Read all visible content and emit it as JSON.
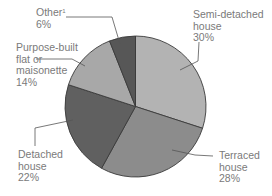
{
  "chart_data": {
    "type": "pie",
    "title": "",
    "start_angle_deg": 0,
    "direction": "clockwise",
    "slices": [
      {
        "label": "Semi-detached house",
        "value": 30,
        "color": "#b3b3b3",
        "lines": [
          "Semi-detached",
          "house",
          "30%"
        ]
      },
      {
        "label": "Terraced house",
        "value": 28,
        "color": "#8c8c8c",
        "lines": [
          "Terraced",
          "house",
          "28%"
        ]
      },
      {
        "label": "Detached house",
        "value": 22,
        "color": "#606060",
        "lines": [
          "Detached",
          "house",
          "22%"
        ]
      },
      {
        "label": "Purpose-built flat or maisonette",
        "value": 14,
        "color": "#a8a8a8",
        "lines": [
          "Purpose-built",
          "flat or",
          "maisonette",
          "14%"
        ]
      },
      {
        "label": "Other",
        "value": 6,
        "color": "#575757",
        "lines": [
          "Other",
          "6%"
        ],
        "footnote": "1"
      }
    ],
    "units": "%",
    "legend": "none (direct labels with leader lines)"
  },
  "labels": {
    "semi": {
      "l1": "Semi-detached",
      "l2": "house",
      "l3": "30%"
    },
    "terraced": {
      "l1": "Terraced",
      "l2": "house",
      "l3": "28%"
    },
    "detached": {
      "l1": "Detached",
      "l2": "house",
      "l3": "22%"
    },
    "flat": {
      "l1": "Purpose-built",
      "l2": "flat or",
      "l3": "maisonette",
      "l4": "14%"
    },
    "other": {
      "l1": "Other",
      "sup": "1",
      "l2": "6%"
    }
  }
}
